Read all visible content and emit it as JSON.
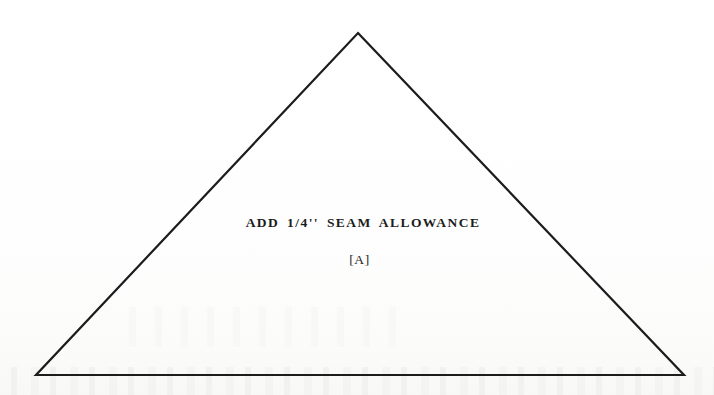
{
  "document": {
    "type": "sewing-pattern-piece",
    "background_color": "#fefefe",
    "ink_color": "#1c1c1c"
  },
  "shape": {
    "name": "triangle",
    "stroke_color": "#1c1c1c",
    "stroke_width": 2.2,
    "fill": "none",
    "vertices": [
      {
        "label": "apex",
        "x": 358,
        "y": 33
      },
      {
        "label": "bottom-right",
        "x": 684,
        "y": 375
      },
      {
        "label": "bottom-left",
        "x": 36,
        "y": 375
      }
    ]
  },
  "annotations": {
    "seam_allowance_note": "ADD 1/4'' SEAM ALLOWANCE",
    "piece_id": "[A]"
  }
}
